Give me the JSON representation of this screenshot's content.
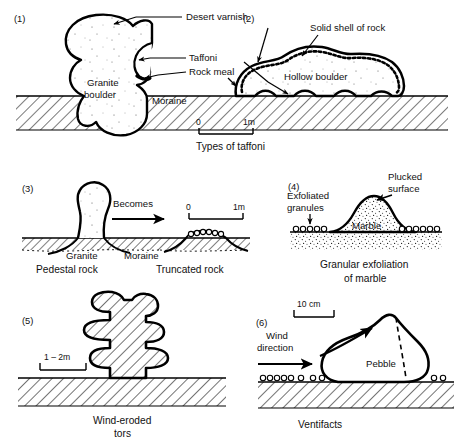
{
  "figure": {
    "background": "#ffffff",
    "ink": "#000000"
  },
  "panels": [
    {
      "number": "(1)",
      "caption": "Types of taffoni",
      "labels": {
        "desert_varnish": "Desert varnish",
        "taffoni": "Taffoni",
        "rock_meal": "Rock meal",
        "granite_boulder_line1": "Granite",
        "granite_boulder_line2": "boulder",
        "moraine": "Moraine"
      },
      "scale": {
        "zero": "0",
        "max": "1m"
      }
    },
    {
      "number": "(2)",
      "labels": {
        "solid_shell": "Solid shell of rock",
        "hollow_boulder": "Hollow boulder"
      }
    },
    {
      "number": "(3)",
      "caption_left": "Pedestal rock",
      "caption_right": "Truncated rock",
      "labels": {
        "becomes": "Becomes",
        "granite": "Granite",
        "moraine": "Moraine"
      },
      "scale": {
        "zero": "0",
        "max": "1m"
      }
    },
    {
      "number": "(4)",
      "caption_line1": "Granular exfoliation",
      "caption_line2": "of marble",
      "labels": {
        "exfoliated_line1": "Exfoliated",
        "exfoliated_line2": "granules",
        "plucked_line1": "Plucked",
        "plucked_line2": "surface",
        "marble": "Marble"
      }
    },
    {
      "number": "(5)",
      "caption_line1": "Wind-eroded",
      "caption_line2": "tors",
      "scale": {
        "label": "1 – 2m"
      }
    },
    {
      "number": "(6)",
      "caption": "Ventifacts",
      "labels": {
        "wind_line1": "Wind",
        "wind_line2": "direction",
        "pebble": "Pebble"
      },
      "scale": {
        "label": "10 cm"
      }
    }
  ]
}
